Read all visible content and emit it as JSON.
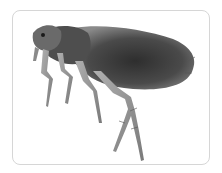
{
  "image": {
    "subject": "flea",
    "description": "Macro photograph of a flea in side profile on a white background inside a rounded light-gray frame",
    "colors": {
      "background": "#ffffff",
      "frame_border": "#d6d6d6",
      "body_dark": "#3a3a3a",
      "body_mid": "#6b6b6b",
      "legs": "#9a9a9a"
    }
  }
}
